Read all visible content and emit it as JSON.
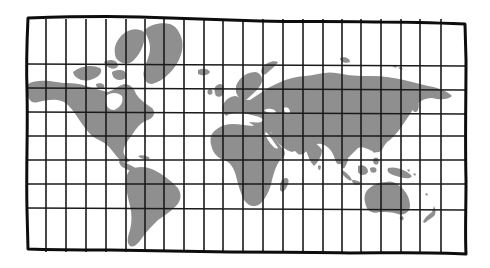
{
  "map": {
    "title": "",
    "projection": "mercator-style grid",
    "colors": {
      "background": "#ffffff",
      "land": "#8f8f8f",
      "grid": "#1a1a1a",
      "frame": "#0d0d0d"
    },
    "frame": {
      "x": 27,
      "y": 19,
      "width": 438,
      "height": 233
    },
    "grid": {
      "columns": 22,
      "rows": 8,
      "vertical_lines_x": [
        46,
        66,
        86,
        106,
        126,
        145,
        164,
        184,
        204,
        223,
        243,
        263,
        283,
        303,
        323,
        342,
        361,
        381,
        401,
        420,
        441
      ],
      "horizontal_lines_y": [
        64,
        88,
        112,
        136,
        160,
        184,
        208
      ]
    },
    "landmasses": [
      "north-america",
      "greenland",
      "arctic-islands",
      "central-america",
      "south-america",
      "europe",
      "africa",
      "madagascar",
      "asia",
      "japan",
      "southeast-asia-islands",
      "new-guinea",
      "australia",
      "new-zealand",
      "british-isles",
      "iceland",
      "novaya-zemlya"
    ]
  }
}
